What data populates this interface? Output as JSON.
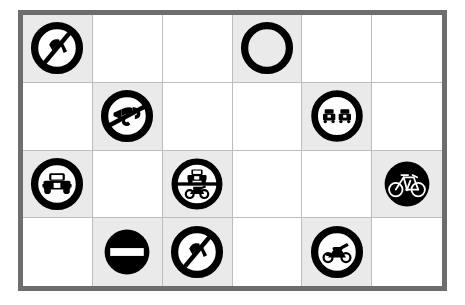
{
  "board": {
    "rows": 4,
    "columns": 6,
    "frame_color": "#6d6d6d",
    "grid_line_color": "#bdbdbd",
    "filled_cell_color": "#eaeaea",
    "empty_cell_color": "#ffffff",
    "sign_color": "#000000"
  },
  "cells": [
    {
      "row": 1,
      "col": 1,
      "filled": true,
      "icon": "no-horn-slash-icon",
      "label": "No horn"
    },
    {
      "row": 1,
      "col": 2,
      "filled": false,
      "icon": null,
      "label": ""
    },
    {
      "row": 1,
      "col": 3,
      "filled": false,
      "icon": null,
      "label": ""
    },
    {
      "row": 1,
      "col": 4,
      "filled": true,
      "icon": "blank-prohibition-ring-icon",
      "label": "Blank ring"
    },
    {
      "row": 1,
      "col": 5,
      "filled": false,
      "icon": null,
      "label": ""
    },
    {
      "row": 1,
      "col": 6,
      "filled": false,
      "icon": null,
      "label": ""
    },
    {
      "row": 2,
      "col": 1,
      "filled": false,
      "icon": null,
      "label": ""
    },
    {
      "row": 2,
      "col": 2,
      "filled": true,
      "icon": "no-horn-icon",
      "label": "No honking"
    },
    {
      "row": 2,
      "col": 3,
      "filled": false,
      "icon": null,
      "label": ""
    },
    {
      "row": 2,
      "col": 4,
      "filled": false,
      "icon": null,
      "label": ""
    },
    {
      "row": 2,
      "col": 5,
      "filled": true,
      "icon": "no-overtaking-icon",
      "label": "No overtaking"
    },
    {
      "row": 2,
      "col": 6,
      "filled": false,
      "icon": null,
      "label": ""
    },
    {
      "row": 3,
      "col": 1,
      "filled": true,
      "icon": "no-cars-icon",
      "label": "No motor cars"
    },
    {
      "row": 3,
      "col": 2,
      "filled": false,
      "icon": null,
      "label": ""
    },
    {
      "row": 3,
      "col": 3,
      "filled": true,
      "icon": "no-motor-vehicles-icon",
      "label": "No motor vehicles"
    },
    {
      "row": 3,
      "col": 4,
      "filled": false,
      "icon": null,
      "label": ""
    },
    {
      "row": 3,
      "col": 5,
      "filled": false,
      "icon": null,
      "label": ""
    },
    {
      "row": 3,
      "col": 6,
      "filled": true,
      "icon": "bicycle-inverted-icon",
      "label": "Bicycle"
    },
    {
      "row": 4,
      "col": 1,
      "filled": false,
      "icon": null,
      "label": ""
    },
    {
      "row": 4,
      "col": 2,
      "filled": true,
      "icon": "no-entry-icon",
      "label": "No entry"
    },
    {
      "row": 4,
      "col": 3,
      "filled": true,
      "icon": "no-horn-slash-icon",
      "label": "No horn"
    },
    {
      "row": 4,
      "col": 4,
      "filled": false,
      "icon": null,
      "label": ""
    },
    {
      "row": 4,
      "col": 5,
      "filled": true,
      "icon": "no-motorcycles-icon",
      "label": "Motorcycle"
    },
    {
      "row": 4,
      "col": 6,
      "filled": false,
      "icon": null,
      "label": ""
    }
  ]
}
